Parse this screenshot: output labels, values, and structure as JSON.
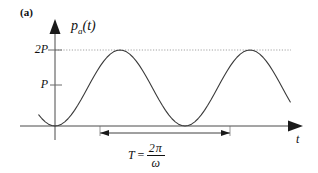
{
  "figure": {
    "panel_label": "(a)",
    "y_axis_label_main": "p",
    "y_axis_label_sub": "a",
    "y_axis_label_arg": "(t)",
    "x_axis_label": "t",
    "ticks": [
      {
        "name": "tick-2P",
        "label": "2P",
        "value": 2
      },
      {
        "name": "tick-P",
        "label": "P",
        "value": 1
      }
    ],
    "period_formula": {
      "lhs": "T",
      "equals": "=",
      "numerator": "2π",
      "denominator": "ω"
    },
    "colors": {
      "curve": "#3a3a3a",
      "axis": "#4a4a4a",
      "guide": "#8a8a8a",
      "text": "#101010",
      "background": "#ffffff"
    }
  },
  "chart_data": {
    "type": "line",
    "title": "",
    "subtitle": "",
    "xlabel": "t",
    "ylabel": "p_a(t)",
    "legend": [],
    "grid": false,
    "annotations": [
      {
        "name": "panel-label",
        "text": "(a)"
      },
      {
        "name": "period-dimension",
        "text": "T = 2π/ω",
        "from_x": 0.5,
        "to_x": 2.5
      },
      {
        "name": "peak-guide-line",
        "text": "",
        "y": 2
      }
    ],
    "xlim": [
      -0.25,
      4.05
    ],
    "ylim": [
      0,
      2.35
    ],
    "ytick_values": [
      1,
      2
    ],
    "ytick_labels": [
      "P",
      "2P"
    ],
    "xtick_values": [],
    "xtick_labels": [],
    "series": [
      {
        "name": "p_a(t)",
        "formula": "P(1 - cos(ωt))",
        "amplitude": 1,
        "offset": 1,
        "period": 1,
        "phase": 0,
        "x_start": -0.25,
        "x_end": 3.62,
        "points": [
          [
            -0.25,
            0.2929
          ],
          [
            -0.2,
            0.191
          ],
          [
            -0.15,
            0.109
          ],
          [
            -0.1,
            0.0489
          ],
          [
            -0.05,
            0.0123
          ],
          [
            0.0,
            0.0
          ],
          [
            0.05,
            0.0123
          ],
          [
            0.1,
            0.0489
          ],
          [
            0.15,
            0.109
          ],
          [
            0.2,
            0.191
          ],
          [
            0.25,
            0.2929
          ],
          [
            0.3,
            0.4122
          ],
          [
            0.35,
            0.546
          ],
          [
            0.4,
            0.691
          ],
          [
            0.45,
            0.8436
          ],
          [
            0.5,
            1.0
          ],
          [
            0.55,
            1.1564
          ],
          [
            0.6,
            1.309
          ],
          [
            0.65,
            1.454
          ],
          [
            0.7,
            1.5878
          ],
          [
            0.75,
            1.7071
          ],
          [
            0.8,
            1.809
          ],
          [
            0.85,
            1.891
          ],
          [
            0.9,
            1.9511
          ],
          [
            0.95,
            1.9877
          ],
          [
            1.0,
            2.0
          ],
          [
            1.05,
            1.9877
          ],
          [
            1.1,
            1.9511
          ],
          [
            1.15,
            1.891
          ],
          [
            1.2,
            1.809
          ],
          [
            1.25,
            1.7071
          ],
          [
            1.3,
            1.5878
          ],
          [
            1.35,
            1.454
          ],
          [
            1.4,
            1.309
          ],
          [
            1.45,
            1.1564
          ],
          [
            1.5,
            1.0
          ],
          [
            1.55,
            0.8436
          ],
          [
            1.6,
            0.691
          ],
          [
            1.65,
            0.546
          ],
          [
            1.7,
            0.4122
          ],
          [
            1.75,
            0.2929
          ],
          [
            1.8,
            0.191
          ],
          [
            1.85,
            0.109
          ],
          [
            1.9,
            0.0489
          ],
          [
            1.95,
            0.0123
          ],
          [
            2.0,
            0.0
          ],
          [
            2.05,
            0.0123
          ],
          [
            2.1,
            0.0489
          ],
          [
            2.15,
            0.109
          ],
          [
            2.2,
            0.191
          ],
          [
            2.25,
            0.2929
          ],
          [
            2.3,
            0.4122
          ],
          [
            2.35,
            0.546
          ],
          [
            2.4,
            0.691
          ],
          [
            2.45,
            0.8436
          ],
          [
            2.5,
            1.0
          ],
          [
            2.55,
            1.1564
          ],
          [
            2.6,
            1.309
          ],
          [
            2.65,
            1.454
          ],
          [
            2.7,
            1.5878
          ],
          [
            2.75,
            1.7071
          ],
          [
            2.8,
            1.809
          ],
          [
            2.85,
            1.891
          ],
          [
            2.9,
            1.9511
          ],
          [
            2.95,
            1.9877
          ],
          [
            3.0,
            2.0
          ],
          [
            3.05,
            1.9877
          ],
          [
            3.1,
            1.9511
          ],
          [
            3.15,
            1.891
          ],
          [
            3.2,
            1.809
          ],
          [
            3.25,
            1.7071
          ],
          [
            3.3,
            1.5878
          ],
          [
            3.35,
            1.454
          ],
          [
            3.4,
            1.309
          ],
          [
            3.45,
            1.1564
          ],
          [
            3.5,
            1.0
          ],
          [
            3.55,
            0.8436
          ],
          [
            3.6,
            0.691
          ],
          [
            3.62,
            0.6318
          ]
        ]
      }
    ]
  }
}
